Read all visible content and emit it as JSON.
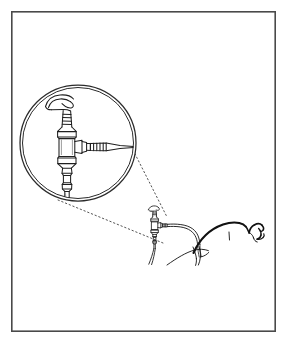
{
  "figure": {
    "kind": "line-art-medical-illustration",
    "title": "Nasogastric tube connector with magnified inset",
    "caption": "",
    "background_color": "#ffffff",
    "ink_color": "#1a1a1a",
    "canvas": {
      "width": 287,
      "height": 343
    }
  },
  "frame": {
    "name": "illustration-border",
    "x": 11,
    "y": 11,
    "width": 265,
    "height": 321,
    "stroke_color": "#4a4a4a",
    "stroke_width": 1.6
  },
  "magnifier": {
    "name": "magnified-detail-circle",
    "center_x": 78,
    "center_y": 143,
    "radius": 58,
    "inner_radius": 55.5,
    "stroke_color": "#2b2b2b",
    "stroke_width": 1.3,
    "label": "Magnified detail of connector assembly"
  },
  "leader_lines": {
    "name": "callout-leader-lines",
    "style": "dotted",
    "stroke_color": "#555555",
    "stroke_width": 1,
    "dash": "1.4 2.6",
    "lines": [
      {
        "name": "upper-leader",
        "x1": 133,
        "y1": 150,
        "x2": 167,
        "y2": 217
      },
      {
        "name": "lower-leader",
        "x1": 58,
        "y1": 200,
        "x2": 163,
        "y2": 243
      }
    ]
  },
  "inset_device": {
    "name": "connector-assembly-magnified",
    "parts": [
      {
        "name": "hook-tip",
        "label": "Curved hook tip"
      },
      {
        "name": "ribbed-shaft",
        "label": "Ribbed upper shaft"
      },
      {
        "name": "luer-body",
        "label": "Luer lock body"
      },
      {
        "name": "side-port",
        "label": "Side port adapter"
      },
      {
        "name": "ribbed-collar",
        "label": "Ribbed collar"
      },
      {
        "name": "tapered-tip",
        "label": "Tapered nozzle tip"
      },
      {
        "name": "lower-stem",
        "label": "Lower stem and tubing"
      }
    ]
  },
  "scene": {
    "name": "patient-scene",
    "elements": [
      {
        "name": "connector-device",
        "label": "Connector device in situ"
      },
      {
        "name": "feeding-tube",
        "label": "Flexible tubing"
      },
      {
        "name": "patient-figure",
        "label": "Patient reclining in profile"
      },
      {
        "name": "patient-head",
        "label": "Patient head and face"
      },
      {
        "name": "patient-shoulder",
        "label": "Patient shoulder and neck"
      }
    ]
  },
  "annotations": {
    "text_labels": []
  }
}
